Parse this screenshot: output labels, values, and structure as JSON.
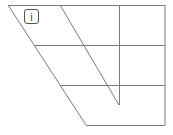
{
  "diagram": {
    "type": "vowel-trapezoid",
    "line_color": "#7a7a7a",
    "symbols": [
      {
        "label": "i",
        "position": "close-front"
      }
    ]
  }
}
